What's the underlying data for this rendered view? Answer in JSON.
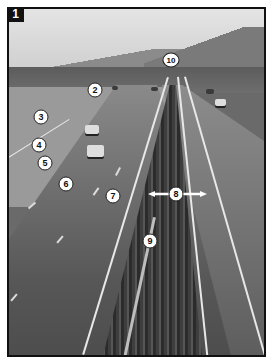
{
  "figure": {
    "panel_label": "1",
    "colors": {
      "border": "#111111",
      "callout_fill": "#ffffff",
      "callout_text": "#111111",
      "badge_fill": "#111111",
      "badge_text": "#ffffff"
    }
  },
  "callouts": [
    {
      "id": "2",
      "label": "2",
      "x": 95,
      "y": 90
    },
    {
      "id": "3",
      "label": "3",
      "x": 41,
      "y": 117
    },
    {
      "id": "4",
      "label": "4",
      "x": 39,
      "y": 145
    },
    {
      "id": "5",
      "label": "5",
      "x": 45,
      "y": 163
    },
    {
      "id": "6",
      "label": "6",
      "x": 66,
      "y": 184
    },
    {
      "id": "7",
      "label": "7",
      "x": 113,
      "y": 196
    },
    {
      "id": "8",
      "label": "8",
      "x": 176,
      "y": 194,
      "has_double_arrow": true
    },
    {
      "id": "9",
      "label": "9",
      "x": 150,
      "y": 241
    },
    {
      "id": "10",
      "label": "10",
      "x": 171,
      "y": 60
    }
  ]
}
